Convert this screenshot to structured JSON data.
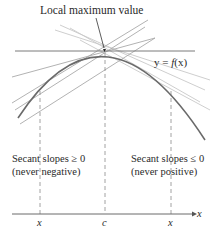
{
  "diagram": {
    "title_annotation": "Local maximum value",
    "function_label": {
      "prefix": "y = ",
      "fn": "f",
      "arg": "(x)"
    },
    "left_region": {
      "line1": "Secant slopes ≥ 0",
      "line2": "(never negative)"
    },
    "right_region": {
      "line1": "Secant slopes ≤ 0",
      "line2": "(never positive)"
    },
    "axis": {
      "name": "x",
      "ticks": [
        {
          "label": "x",
          "pos": 40
        },
        {
          "label": "c",
          "pos": 105
        },
        {
          "label": "x",
          "pos": 171
        }
      ]
    },
    "colors": {
      "curve": "#6a6a6a",
      "tangent": "#7a7a7a",
      "secant_light": "#c8c8c8",
      "secant_mid": "#a9a9a9",
      "dashed": "#8a8a8a",
      "axis": "#6a6a6a",
      "text": "#2a2a2a"
    }
  }
}
